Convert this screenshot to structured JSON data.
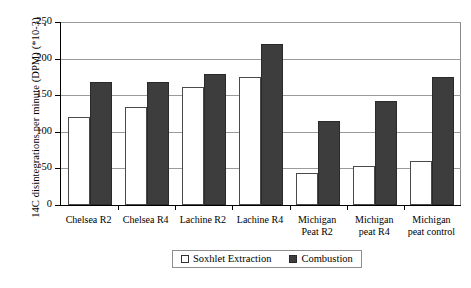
{
  "chart_data": {
    "type": "bar",
    "title": "",
    "xlabel": "",
    "ylabel": "14C disintegrations per minute (DPM) (*10-3)",
    "ylim": [
      0,
      250
    ],
    "ytick_values": [
      0,
      50,
      100,
      150,
      200,
      250
    ],
    "ytick_labels": [
      "0",
      "50",
      "100",
      "150",
      "200",
      "250"
    ],
    "grid": true,
    "legend_position": "bottom-center",
    "categories": [
      "Chelsea R2",
      "Chelsea R4",
      "Lachine R2",
      "Lachine R4",
      "Michigan Peat R2",
      "Michigan peat R4",
      "Michigan peat control"
    ],
    "category_lines": [
      [
        "Chelsea R2"
      ],
      [
        "Chelsea R4"
      ],
      [
        "Lachine R2"
      ],
      [
        "Lachine R4"
      ],
      [
        "Michigan",
        "Peat R2"
      ],
      [
        "Michigan",
        "peat R4"
      ],
      [
        "Michigan",
        "peat control"
      ]
    ],
    "series": [
      {
        "name": "Soxhlet Extraction",
        "color": "#ffffff",
        "values": [
          120,
          134,
          161,
          175,
          44,
          53,
          60
        ]
      },
      {
        "name": "Combustion",
        "color": "#3d3d3d",
        "values": [
          168,
          168,
          179,
          220,
          115,
          142,
          175
        ]
      }
    ]
  },
  "legend": {
    "items": [
      {
        "label": "Soxhlet Extraction",
        "swatch": "hollow-square-icon"
      },
      {
        "label": "Combustion",
        "swatch": "filled-square-icon"
      }
    ]
  }
}
